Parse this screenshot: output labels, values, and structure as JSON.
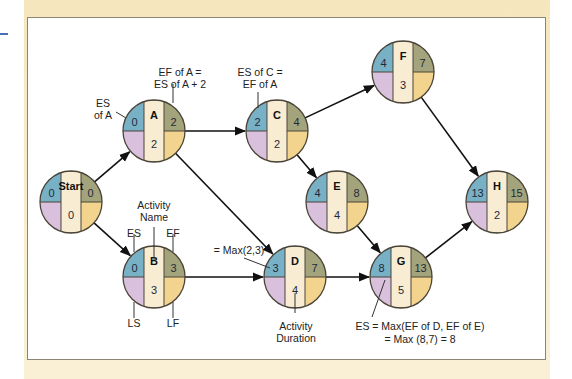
{
  "colors": {
    "es": "#78b0c6",
    "ef": "#a4a47c",
    "ls": "#d9c0dc",
    "lf": "#f3d48e",
    "center": "#f8ecd2",
    "outline": "#4a4438",
    "frame": "#f6e6bd"
  },
  "nodes": [
    {
      "id": "start",
      "name": "Start",
      "es": "0",
      "ef": "0",
      "duration": "0",
      "cx": 71,
      "cy": 202
    },
    {
      "id": "a",
      "name": "A",
      "es": "0",
      "ef": "2",
      "duration": "2",
      "cx": 154,
      "cy": 131
    },
    {
      "id": "b",
      "name": "B",
      "es": "0",
      "ef": "3",
      "duration": "3",
      "cx": 154,
      "cy": 277
    },
    {
      "id": "c",
      "name": "C",
      "es": "2",
      "ef": "4",
      "duration": "2",
      "cx": 277,
      "cy": 131
    },
    {
      "id": "d",
      "name": "D",
      "es": "3",
      "ef": "7",
      "duration": "4",
      "cx": 295,
      "cy": 277
    },
    {
      "id": "e",
      "name": "E",
      "es": "4",
      "ef": "8",
      "duration": "4",
      "cx": 337,
      "cy": 202
    },
    {
      "id": "f",
      "name": "F",
      "es": "4",
      "ef": "7",
      "duration": "3",
      "cx": 403,
      "cy": 72
    },
    {
      "id": "g",
      "name": "G",
      "es": "8",
      "ef": "13",
      "duration": "5",
      "cx": 401,
      "cy": 277
    },
    {
      "id": "h",
      "name": "H",
      "es": "13",
      "ef": "15",
      "duration": "2",
      "cx": 497,
      "cy": 202
    }
  ],
  "edges": [
    {
      "from": "start",
      "to": "a"
    },
    {
      "from": "start",
      "to": "b"
    },
    {
      "from": "a",
      "to": "c"
    },
    {
      "from": "a",
      "to": "d"
    },
    {
      "from": "b",
      "to": "d"
    },
    {
      "from": "c",
      "to": "f"
    },
    {
      "from": "c",
      "to": "e"
    },
    {
      "from": "e",
      "to": "g"
    },
    {
      "from": "d",
      "to": "g"
    },
    {
      "from": "f",
      "to": "h"
    },
    {
      "from": "g",
      "to": "h"
    }
  ],
  "annotations": {
    "es_of_a_line1": "ES",
    "es_of_a_line2": "of A",
    "ef_of_a_line1": "EF of A =",
    "ef_of_a_line2": "ES of A + 2",
    "es_of_c_line1": "ES of C =",
    "es_of_c_line2": "EF of A",
    "activity_name_line1": "Activity",
    "activity_name_line2": "Name",
    "es_label": "ES",
    "ef_label": "EF",
    "ls_label": "LS",
    "lf_label": "LF",
    "max_d": "= Max(2,3)",
    "activity_duration_line1": "Activity",
    "activity_duration_line2": "Duration",
    "es_g_line1": "ES = Max(EF of D, EF of E)",
    "es_g_line2": "= Max (8,7) = 8"
  }
}
